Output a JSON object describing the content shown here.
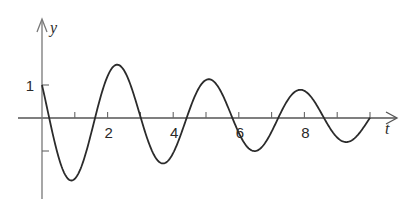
{
  "chart_data": {
    "type": "line",
    "title": "",
    "xlabel": "t",
    "ylabel": "y",
    "xlim": [
      0,
      10.5
    ],
    "ylim": [
      -2.4,
      3
    ],
    "grid": false,
    "legend": null,
    "x_ticks": [
      1,
      2,
      3,
      4,
      5,
      6,
      7,
      8,
      9,
      10
    ],
    "x_tick_labels": [
      {
        "value": 2,
        "label": "2"
      },
      {
        "value": 4,
        "label": "4"
      },
      {
        "value": 6,
        "label": "6"
      },
      {
        "value": 8,
        "label": "8"
      }
    ],
    "y_ticks": [
      1,
      -1
    ],
    "y_tick_labels": [
      {
        "value": 1,
        "label": "1"
      }
    ],
    "model": {
      "form": "A*exp(-k*t)*cos(w*t+phi)",
      "A": 2.1,
      "k": 0.114,
      "w": 2.25,
      "phi": 1.075,
      "t_end": 10.0
    },
    "series": [
      {
        "name": "y(t)",
        "x": [
          0,
          0.92,
          2.31,
          3.71,
          5.1,
          6.5,
          7.9,
          9.28,
          10.0
        ],
        "values": [
          1.0,
          -1.9,
          1.6,
          -1.33,
          1.3,
          -1.0,
          1.03,
          -0.73,
          -0.25
        ]
      }
    ]
  },
  "axes": {
    "x_label": "t",
    "y_label": "y"
  }
}
